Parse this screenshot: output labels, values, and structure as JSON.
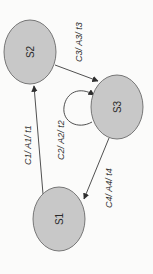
{
  "diagram": {
    "type": "state-transition",
    "orientation": "rotated-90-ccw-text",
    "colors": {
      "node_fill": "#c8c8c8",
      "node_stroke": "#6a6a6a",
      "edge": "#3c3c3c",
      "background": "#fbfbfa"
    },
    "nodes": [
      {
        "id": "S1",
        "label": "S1"
      },
      {
        "id": "S2",
        "label": "S2"
      },
      {
        "id": "S3",
        "label": "S3"
      }
    ],
    "edges": [
      {
        "from": "S1",
        "to": "S2",
        "label": "C1/ A1/ t1"
      },
      {
        "from": "S3",
        "to": "S3",
        "label": "C2/ A2/ t2"
      },
      {
        "from": "S2",
        "to": "S3",
        "label": "C3/ A3/ t3"
      },
      {
        "from": "S3",
        "to": "S1",
        "label": "C4/ A4/ t4"
      }
    ]
  }
}
